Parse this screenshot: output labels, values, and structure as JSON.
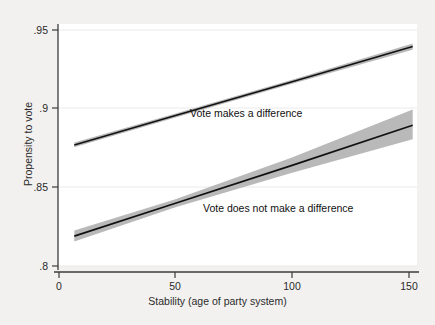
{
  "figure": {
    "background_color": "#f2f1ef",
    "plot_background_color": "#ffffff"
  },
  "chart_data": {
    "type": "line",
    "title": "",
    "xlabel": "Stability (age of party system)",
    "ylabel": "Propensity to vote",
    "xlim": [
      0,
      155
    ],
    "ylim": [
      0.8,
      0.95
    ],
    "xticks": [
      0,
      50,
      100,
      150
    ],
    "xtick_labels": [
      "0",
      "50",
      "100",
      "150"
    ],
    "yticks": [
      0.8,
      0.85,
      0.9,
      0.95
    ],
    "ytick_labels": [
      ".8",
      ".85",
      ".9",
      ".95"
    ],
    "grid": "horizontal-faint",
    "legend_position": "inline-annotations",
    "line_color": "#111111",
    "band_color": "#b9b9b9",
    "series": [
      {
        "name": "Vote makes a difference",
        "annotation": "Vote makes a difference",
        "annotation_x": 72,
        "annotation_y": 0.9055,
        "x": [
          7,
          50,
          100,
          152
        ],
        "values": [
          0.877,
          0.8955,
          0.9169,
          0.9395
        ],
        "ci_lower": [
          0.8755,
          0.8942,
          0.9156,
          0.9375
        ],
        "ci_upper": [
          0.8785,
          0.8968,
          0.9182,
          0.9415
        ]
      },
      {
        "name": "Vote does not make a difference",
        "annotation": "Vote does not make a difference",
        "annotation_x": 78,
        "annotation_y": 0.8405,
        "x": [
          7,
          50,
          100,
          152
        ],
        "values": [
          0.819,
          0.8397,
          0.8638,
          0.8895
        ],
        "ci_lower": [
          0.8155,
          0.8372,
          0.8592,
          0.8805
        ],
        "ci_upper": [
          0.8225,
          0.8422,
          0.8688,
          0.8995
        ]
      }
    ]
  }
}
